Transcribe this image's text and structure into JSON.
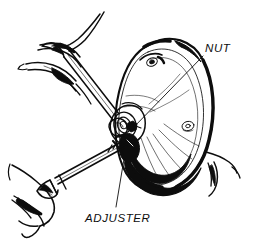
{
  "figure": {
    "background_color": "#ffffff",
    "ink_color": "#0d0d0d",
    "width": 258,
    "height": 243
  },
  "callouts": [
    {
      "id": "nut",
      "label": "NUT",
      "text_x": 205,
      "text_y": 52,
      "leader": {
        "x1": 203,
        "y1": 56,
        "x2": 132,
        "y2": 129
      }
    },
    {
      "id": "adjuster",
      "label": "ADJUSTER",
      "text_x": 85,
      "text_y": 222,
      "leader": {
        "x1": 116,
        "y1": 207,
        "x2": 127,
        "y2": 141
      }
    }
  ],
  "parts": [
    {
      "id": "brake-drum",
      "name": "brake drum"
    },
    {
      "id": "hub-boss",
      "name": "hub boss"
    },
    {
      "id": "adjusting-nut",
      "name": "adjusting nut"
    },
    {
      "id": "wrench",
      "name": "wrench"
    },
    {
      "id": "adjuster-tool",
      "name": "adjuster tool"
    },
    {
      "id": "upper-hand",
      "name": "upper hand"
    },
    {
      "id": "lower-hand",
      "name": "lower hand"
    }
  ]
}
